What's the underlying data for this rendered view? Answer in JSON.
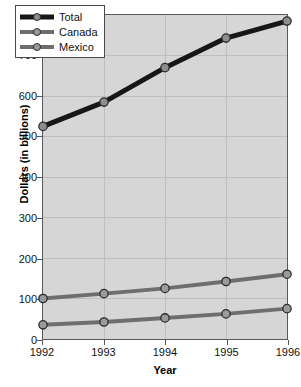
{
  "chart_data": {
    "type": "line",
    "title": "",
    "xlabel": "Year",
    "ylabel": "Dollars (in billions)",
    "categories": [
      "1992",
      "1993",
      "1994",
      "1995",
      "1996"
    ],
    "x": [
      1992,
      1993,
      1994,
      1995,
      1996
    ],
    "xlim": [
      1992,
      1996
    ],
    "ylim": [
      0,
      800
    ],
    "yticks": [
      "0",
      "100",
      "200",
      "300",
      "400",
      "500",
      "600",
      "700",
      "800"
    ],
    "ytick_values": [
      0,
      100,
      200,
      300,
      400,
      500,
      600,
      700,
      800
    ],
    "grid": true,
    "legend_position": "top-left",
    "series": [
      {
        "name": "Total",
        "values": [
          525,
          585,
          670,
          743,
          785
        ],
        "color": "#17171a",
        "line_width": 5,
        "marker": "circle",
        "marker_color": "#8d8d8f"
      },
      {
        "name": "Canada",
        "values": [
          100,
          112,
          125,
          142,
          160
        ],
        "color": "#6e6e70",
        "line_width": 4,
        "marker": "circle",
        "marker_color": "#9a9a9c"
      },
      {
        "name": "Mexico",
        "values": [
          35,
          42,
          52,
          62,
          75
        ],
        "color": "#6e6e70",
        "line_width": 4,
        "marker": "circle",
        "marker_color": "#9a9a9c"
      }
    ]
  },
  "legend": {
    "items": [
      {
        "label": "Total"
      },
      {
        "label": "Canada"
      },
      {
        "label": "Mexico"
      }
    ]
  },
  "colors": {
    "plot_background": "#d6d6d6",
    "page_background": "#ffffff",
    "axis": "#58585a",
    "gridline": "#bdbdbd",
    "text": "#111111"
  }
}
